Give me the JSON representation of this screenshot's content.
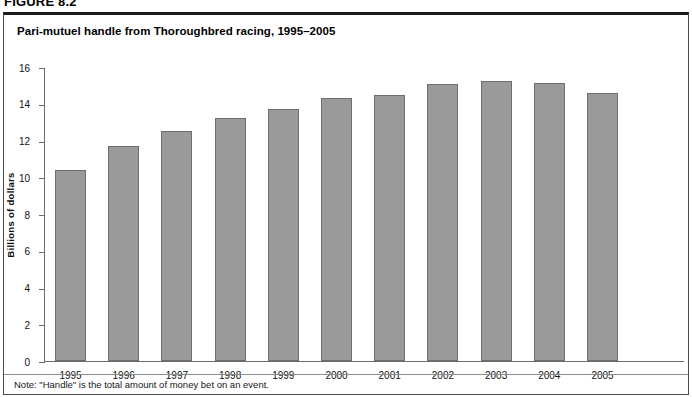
{
  "figure": {
    "number_label": "FIGURE 8.2",
    "title": "Pari-mutuel handle from Thoroughbred racing, 1995–2005",
    "note": "Note: \"Handle\" is the total amount of money bet on an event."
  },
  "colors": {
    "bar_fill": "#9a9a9a",
    "bar_stroke": "#6e6e6e",
    "axis": "#6b6b6b",
    "frame": "#4a4a4a",
    "frame_top": "#1a1a1a",
    "text": "#111111",
    "background": "#ffffff"
  },
  "chart_data": {
    "type": "bar",
    "title": "Pari-mutuel handle from Thoroughbred racing, 1995–2005",
    "xlabel": "",
    "ylabel": "Billions of dollars",
    "categories": [
      "1995",
      "1996",
      "1997",
      "1998",
      "1999",
      "2000",
      "2001",
      "2002",
      "2003",
      "2004",
      "2005"
    ],
    "values": [
      10.4,
      11.7,
      12.5,
      13.2,
      13.7,
      14.3,
      14.5,
      15.1,
      15.25,
      15.15,
      14.6
    ],
    "ylim": [
      0,
      16
    ],
    "ytick_values": [
      0,
      2,
      4,
      6,
      8,
      10,
      12,
      14,
      16
    ],
    "ytick_labels": [
      "0",
      "2",
      "4",
      "6",
      "8",
      "10",
      "12",
      "14",
      "16"
    ],
    "grid": false,
    "legend": null,
    "note": "Note: \"Handle\" is the total amount of money bet on an event."
  }
}
